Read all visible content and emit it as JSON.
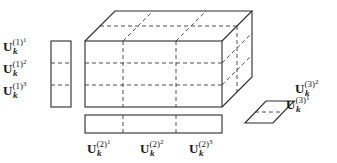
{
  "figure": {
    "stroke_color": "#2a2a2a",
    "background": "#ffffff"
  },
  "mode1_labels": [
    {
      "base": "U",
      "sub": "k",
      "mode": "(1)",
      "index": "1"
    },
    {
      "base": "U",
      "sub": "k",
      "mode": "(1)",
      "index": "2"
    },
    {
      "base": "U",
      "sub": "k",
      "mode": "(1)",
      "index": "3"
    }
  ],
  "mode2_labels": [
    {
      "base": "U",
      "sub": "k",
      "mode": "(2)",
      "index": "1"
    },
    {
      "base": "U",
      "sub": "k",
      "mode": "(2)",
      "index": "2"
    },
    {
      "base": "U",
      "sub": "k",
      "mode": "(2)",
      "index": "3"
    }
  ],
  "mode3_labels": [
    {
      "base": "U",
      "sub": "k",
      "mode": "(3)",
      "index": "2"
    },
    {
      "base": "U",
      "sub": "k",
      "mode": "(3)",
      "index": "1"
    }
  ]
}
